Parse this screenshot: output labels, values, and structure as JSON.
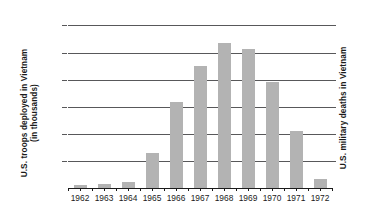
{
  "chart_data": {
    "type": "bar",
    "title": "",
    "subtitle": "",
    "xlabel": "",
    "ylabel": "U.S. troops deployed in Vietnam (in thousands)",
    "ylabel_line1": "U.S. troops deployed in Vietnam",
    "ylabel_line2": "(in thousands)",
    "ylabel_right": "U.S. military deaths in Vietnam",
    "categories": [
      "1962",
      "1963",
      "1964",
      "1965",
      "1966",
      "1967",
      "1968",
      "1969",
      "1970",
      "1971",
      "1972"
    ],
    "values": [
      11,
      16,
      23,
      130,
      317,
      451,
      536,
      512,
      390,
      212,
      35
    ],
    "ylim": [
      0,
      620
    ],
    "yticks": [
      0,
      100,
      200,
      300,
      400,
      500,
      600
    ],
    "ytick_labels": [
      "0",
      "100",
      "200",
      "300",
      "400",
      "500",
      "600"
    ],
    "right_axis_ticks_labeled": false,
    "grid": true,
    "legend": "none",
    "bar_color": "#b3b3b3",
    "axis_color": "#1b1b1b",
    "grid_color": "#58585a",
    "background": "#ffffff"
  }
}
